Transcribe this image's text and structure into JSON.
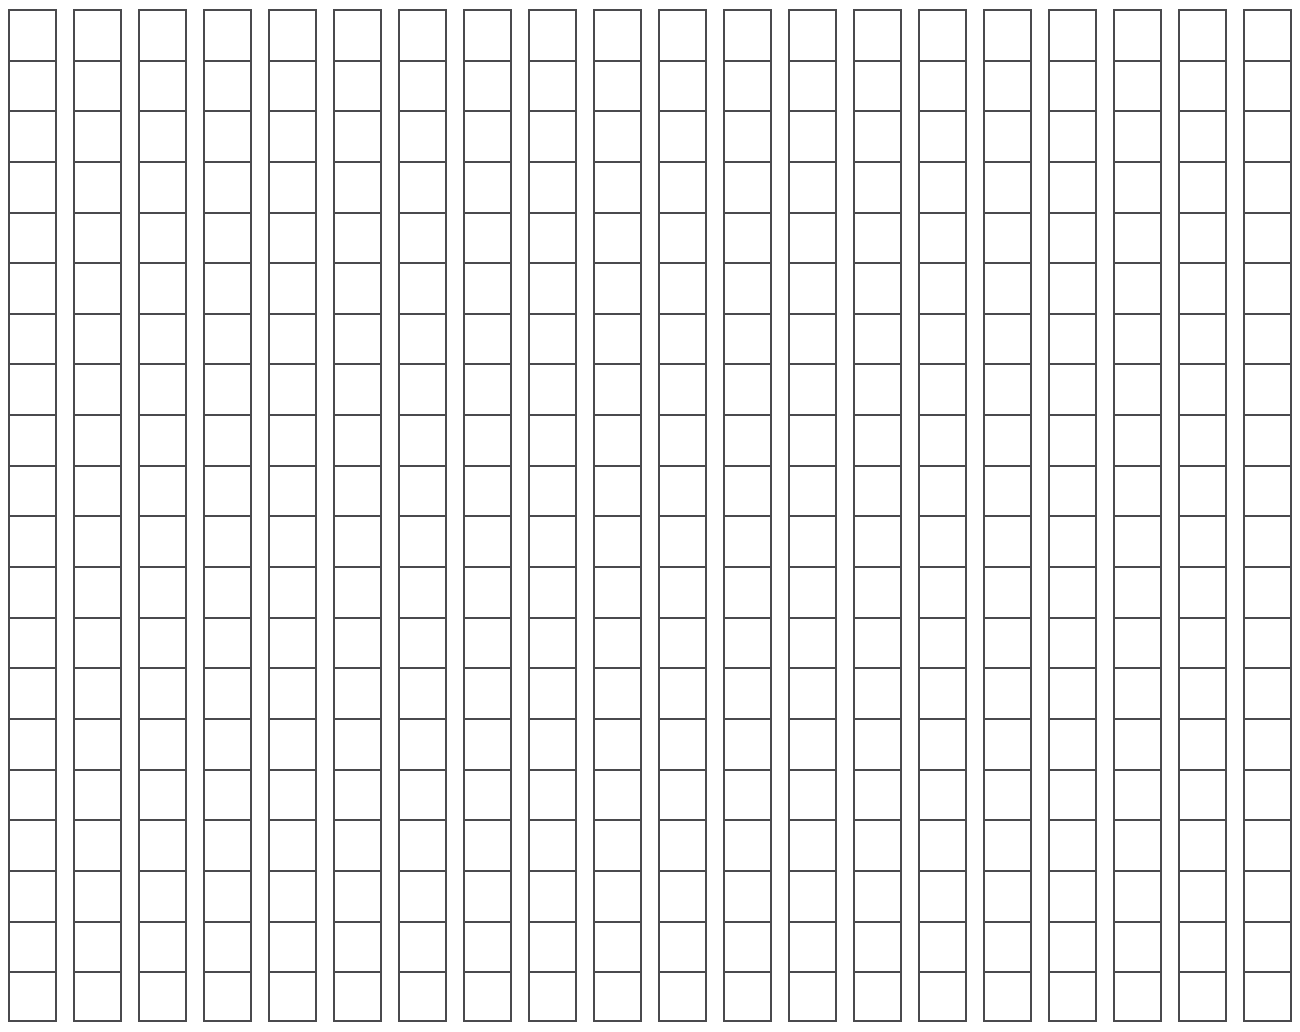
{
  "document": {
    "title": "Blank Grid Worksheet",
    "kind": "blank-grid",
    "background_color": "#ffffff"
  },
  "grid": {
    "columns": 20,
    "rows": 20,
    "cell_width_px": 50,
    "cell_height_px": 51,
    "column_gap_px": 16,
    "row_gap_px": 0,
    "border_color": "#4a4a4d",
    "border_width_px": 2,
    "cell_fill_color": "#ffffff",
    "origin_x_px": 8,
    "origin_y_px": 9,
    "cell_value": "",
    "column_labels": [
      "",
      "",
      "",
      "",
      "",
      "",
      "",
      "",
      "",
      "",
      "",
      "",
      "",
      "",
      "",
      "",
      "",
      "",
      "",
      ""
    ],
    "row_labels": [
      "",
      "",
      "",
      "",
      "",
      "",
      "",
      "",
      "",
      "",
      "",
      "",
      "",
      "",
      "",
      "",
      "",
      "",
      "",
      ""
    ],
    "cells": [
      [
        "",
        "",
        "",
        "",
        "",
        "",
        "",
        "",
        "",
        "",
        "",
        "",
        "",
        "",
        "",
        "",
        "",
        "",
        "",
        ""
      ],
      [
        "",
        "",
        "",
        "",
        "",
        "",
        "",
        "",
        "",
        "",
        "",
        "",
        "",
        "",
        "",
        "",
        "",
        "",
        "",
        ""
      ],
      [
        "",
        "",
        "",
        "",
        "",
        "",
        "",
        "",
        "",
        "",
        "",
        "",
        "",
        "",
        "",
        "",
        "",
        "",
        "",
        ""
      ],
      [
        "",
        "",
        "",
        "",
        "",
        "",
        "",
        "",
        "",
        "",
        "",
        "",
        "",
        "",
        "",
        "",
        "",
        "",
        "",
        ""
      ],
      [
        "",
        "",
        "",
        "",
        "",
        "",
        "",
        "",
        "",
        "",
        "",
        "",
        "",
        "",
        "",
        "",
        "",
        "",
        "",
        ""
      ],
      [
        "",
        "",
        "",
        "",
        "",
        "",
        "",
        "",
        "",
        "",
        "",
        "",
        "",
        "",
        "",
        "",
        "",
        "",
        "",
        ""
      ],
      [
        "",
        "",
        "",
        "",
        "",
        "",
        "",
        "",
        "",
        "",
        "",
        "",
        "",
        "",
        "",
        "",
        "",
        "",
        "",
        ""
      ],
      [
        "",
        "",
        "",
        "",
        "",
        "",
        "",
        "",
        "",
        "",
        "",
        "",
        "",
        "",
        "",
        "",
        "",
        "",
        "",
        ""
      ],
      [
        "",
        "",
        "",
        "",
        "",
        "",
        "",
        "",
        "",
        "",
        "",
        "",
        "",
        "",
        "",
        "",
        "",
        "",
        "",
        ""
      ],
      [
        "",
        "",
        "",
        "",
        "",
        "",
        "",
        "",
        "",
        "",
        "",
        "",
        "",
        "",
        "",
        "",
        "",
        "",
        "",
        ""
      ],
      [
        "",
        "",
        "",
        "",
        "",
        "",
        "",
        "",
        "",
        "",
        "",
        "",
        "",
        "",
        "",
        "",
        "",
        "",
        "",
        ""
      ],
      [
        "",
        "",
        "",
        "",
        "",
        "",
        "",
        "",
        "",
        "",
        "",
        "",
        "",
        "",
        "",
        "",
        "",
        "",
        "",
        ""
      ],
      [
        "",
        "",
        "",
        "",
        "",
        "",
        "",
        "",
        "",
        "",
        "",
        "",
        "",
        "",
        "",
        "",
        "",
        "",
        "",
        ""
      ],
      [
        "",
        "",
        "",
        "",
        "",
        "",
        "",
        "",
        "",
        "",
        "",
        "",
        "",
        "",
        "",
        "",
        "",
        "",
        "",
        ""
      ],
      [
        "",
        "",
        "",
        "",
        "",
        "",
        "",
        "",
        "",
        "",
        "",
        "",
        "",
        "",
        "",
        "",
        "",
        "",
        "",
        ""
      ],
      [
        "",
        "",
        "",
        "",
        "",
        "",
        "",
        "",
        "",
        "",
        "",
        "",
        "",
        "",
        "",
        "",
        "",
        "",
        "",
        ""
      ],
      [
        "",
        "",
        "",
        "",
        "",
        "",
        "",
        "",
        "",
        "",
        "",
        "",
        "",
        "",
        "",
        "",
        "",
        "",
        "",
        ""
      ],
      [
        "",
        "",
        "",
        "",
        "",
        "",
        "",
        "",
        "",
        "",
        "",
        "",
        "",
        "",
        "",
        "",
        "",
        "",
        "",
        ""
      ],
      [
        "",
        "",
        "",
        "",
        "",
        "",
        "",
        "",
        "",
        "",
        "",
        "",
        "",
        "",
        "",
        "",
        "",
        "",
        "",
        ""
      ],
      [
        "",
        "",
        "",
        "",
        "",
        "",
        "",
        "",
        "",
        "",
        "",
        "",
        "",
        "",
        "",
        "",
        "",
        "",
        "",
        ""
      ]
    ]
  }
}
